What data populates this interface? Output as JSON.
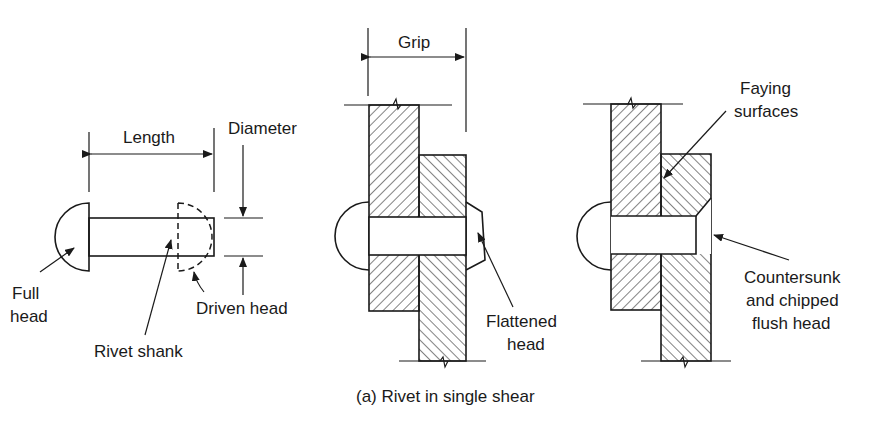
{
  "figure": {
    "caption": "(a) Rivet in single shear",
    "colors": {
      "ink": "#1a1a1a",
      "background": "#ffffff"
    }
  },
  "left_diagram": {
    "title": "Rivet (undriven)",
    "labels": {
      "length": "Length",
      "diameter": "Diameter",
      "full_head_line1": "Full",
      "full_head_line2": "head",
      "driven_head": "Driven head",
      "rivet_shank": "Rivet shank"
    }
  },
  "middle_diagram": {
    "labels": {
      "grip": "Grip",
      "flattened_line1": "Flattened",
      "flattened_line2": "head"
    }
  },
  "right_diagram": {
    "labels": {
      "faying_line1": "Faying",
      "faying_line2": "surfaces",
      "countersunk_line1": "Countersunk",
      "countersunk_line2": "and chipped",
      "countersunk_line3": "flush head"
    }
  }
}
